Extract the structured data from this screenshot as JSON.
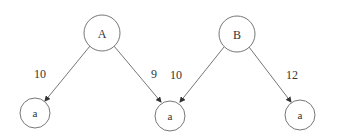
{
  "diagram": {
    "type": "tree",
    "nodes": [
      {
        "id": "A",
        "label": "A",
        "cx": 102,
        "cy": 33,
        "r": 18
      },
      {
        "id": "B",
        "label": "B",
        "cx": 237,
        "cy": 34,
        "r": 18
      },
      {
        "id": "a1",
        "label": "a",
        "cx": 35,
        "cy": 113,
        "r": 15
      },
      {
        "id": "a2",
        "label": "a",
        "cx": 170,
        "cy": 115,
        "r": 15
      },
      {
        "id": "a3",
        "label": "a",
        "cx": 300,
        "cy": 115,
        "r": 15
      }
    ],
    "edges": [
      {
        "from": "A",
        "to": "a1",
        "label": "10"
      },
      {
        "from": "A",
        "to": "a2",
        "label": "9"
      },
      {
        "from": "B",
        "to": "a2",
        "label": "10"
      },
      {
        "from": "B",
        "to": "a3",
        "label": "12"
      }
    ]
  }
}
